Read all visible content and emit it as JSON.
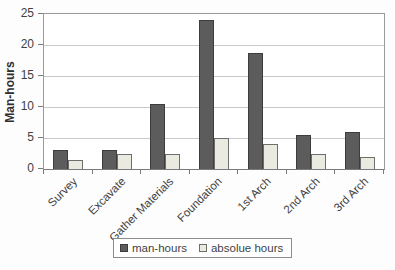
{
  "chart_data": {
    "type": "bar",
    "title": "",
    "xlabel": "",
    "ylabel": "Man-hours",
    "categories": [
      "Survey",
      "Excavate",
      "Gather Materials",
      "Foundation",
      "1st Arch",
      "2nd Arch",
      "3rd Arch"
    ],
    "series": [
      {
        "name": "man-hours",
        "values": [
          3.0,
          3.0,
          10.5,
          24.0,
          18.7,
          5.5,
          6.0
        ],
        "fill": "#5c5c5c",
        "border": "#3d3d3d"
      },
      {
        "name": "absolue hours",
        "values": [
          1.5,
          2.5,
          2.5,
          5.0,
          4.0,
          2.5,
          2.0
        ],
        "fill": "#eaeae1",
        "border": "#6e6e6e"
      }
    ],
    "ylim": [
      0,
      25
    ],
    "yticks": [
      0,
      5,
      10,
      15,
      20,
      25
    ],
    "grid": true,
    "legend_position": "bottom"
  },
  "colors": {
    "plot_background": "#ffffff",
    "page_background": "#fdfdfd",
    "gridline": "#c9c9c9",
    "axis": "#7a7a7a",
    "plot_border": "#9a9a9a",
    "text": "#3f3f3f"
  }
}
